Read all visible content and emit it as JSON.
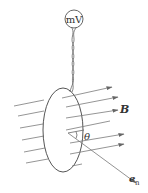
{
  "figure": {
    "meter_label": "mV",
    "field_label": "B",
    "angle_label": "θ",
    "normal_label_main": "e",
    "normal_label_sub": "n",
    "colors": {
      "stroke": "#555555",
      "field_line": "#7a7a7a",
      "background": "#ffffff"
    },
    "field_lines_count": 7
  }
}
